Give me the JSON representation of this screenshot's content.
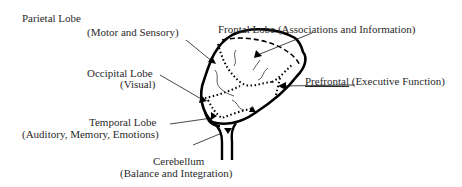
{
  "diagram": {
    "type": "brain-lobes-illustration",
    "labels": {
      "parietal": {
        "name": "Parietal Lobe",
        "desc": "(Motor and Sensory)"
      },
      "frontal": {
        "name": "Frontal Lobe",
        "desc": "(Associations and Information)"
      },
      "occipital": {
        "name": "Occipital Lobe",
        "desc": "(Visual)"
      },
      "prefrontal": {
        "name": "Prefrontal",
        "desc": "(Executive Function)"
      },
      "temporal": {
        "name": "Temporal Lobe",
        "desc": "(Auditory, Memory, Emotions)"
      },
      "cerebellum": {
        "name": "Cerebellum",
        "desc": "(Balance and Integration)"
      }
    },
    "colors": {
      "outline": "#000000",
      "text": "#2a2a2a",
      "background": "#ffffff"
    }
  }
}
